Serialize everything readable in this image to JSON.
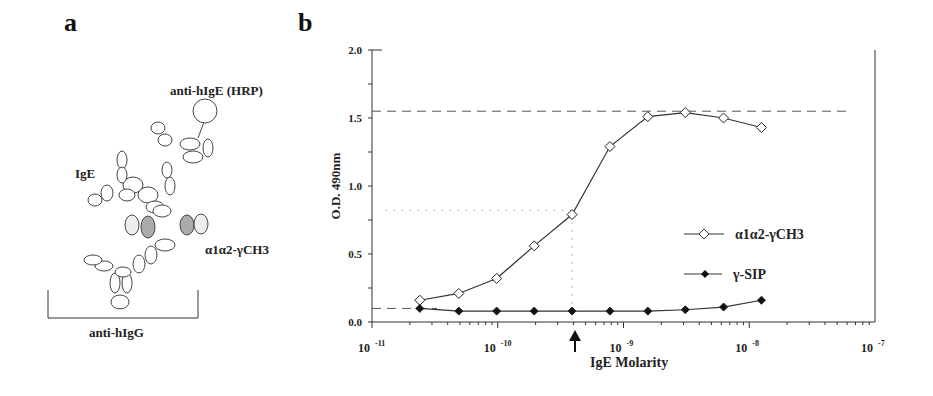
{
  "panels": {
    "a": {
      "label": "a",
      "labels": {
        "hrp": "anti-hIgE (HRP)",
        "ige": "IgE",
        "construct": "α1α2-γCH3",
        "capture": "anti-hIgG"
      }
    },
    "b": {
      "label": "b"
    }
  },
  "chart_data": {
    "type": "line",
    "title": "",
    "xlabel": "IgE Molarity",
    "ylabel": "O.D. 490nm",
    "xscale": "log",
    "xlim": [
      1e-11,
      1e-07
    ],
    "ylim": [
      0,
      2.0
    ],
    "x_tick_labels": [
      "10 -11",
      "10 -10",
      "10 -9",
      "10 -8",
      "10 -7"
    ],
    "y_tick_labels": [
      "0.0",
      "0.5",
      "1.0",
      "1.5",
      "2.0"
    ],
    "legend_position": "right-middle",
    "x": [
      2.4e-11,
      4.9e-11,
      9.8e-11,
      1.95e-10,
      3.9e-10,
      7.8e-10,
      1.56e-09,
      3.1e-09,
      6.25e-09,
      1.25e-08
    ],
    "series": [
      {
        "name": "α1α2-γCH3",
        "marker": "open-diamond",
        "values": [
          0.16,
          0.21,
          0.32,
          0.56,
          0.79,
          1.29,
          1.51,
          1.54,
          1.5,
          1.43
        ]
      },
      {
        "name": "γ-SIP",
        "marker": "filled-diamond",
        "values": [
          0.1,
          0.08,
          0.08,
          0.08,
          0.08,
          0.08,
          0.08,
          0.09,
          0.11,
          0.16
        ]
      }
    ],
    "annotations": [
      {
        "type": "dashed-hline",
        "y": 1.55,
        "note": "max"
      },
      {
        "type": "dashed-hline",
        "y": 0.1,
        "note": "background"
      },
      {
        "type": "dotted-hline",
        "y": 0.82,
        "note": "half-max"
      },
      {
        "type": "dotted-vline",
        "x": 3.9e-10
      },
      {
        "type": "arrow",
        "x": 3.9e-10,
        "note": "EC50 marker below axis"
      }
    ]
  }
}
